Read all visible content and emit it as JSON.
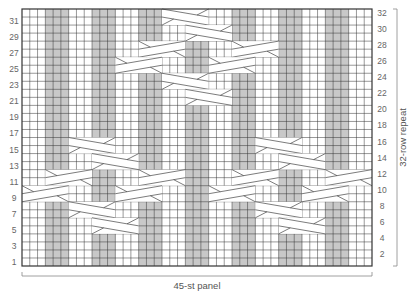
{
  "chart_data": {
    "type": "knitting-chart",
    "stitches": 45,
    "rows": 32,
    "bottom_label": "45-st panel",
    "side_label": "32-row repeat",
    "left_row_numbers": [
      1,
      3,
      5,
      7,
      9,
      11,
      13,
      15,
      17,
      19,
      21,
      23,
      25,
      27,
      29,
      31
    ],
    "right_row_numbers": [
      2,
      4,
      6,
      8,
      10,
      12,
      14,
      16,
      18,
      20,
      22,
      24,
      26,
      28,
      30,
      32
    ],
    "purl_columns": [
      [
        3,
        5
      ],
      [
        9,
        11
      ],
      [
        15,
        17
      ],
      [
        21,
        23
      ],
      [
        27,
        29
      ],
      [
        33,
        35
      ],
      [
        39,
        41
      ]
    ],
    "cables": [
      {
        "row": 31,
        "from": 18,
        "to": 24,
        "dir": "down-right"
      },
      {
        "row": 29,
        "from": 21,
        "to": 27,
        "dir": "down-right"
      },
      {
        "row": 27,
        "from": 15,
        "to": 21,
        "dir": "up-right"
      },
      {
        "row": 27,
        "from": 27,
        "to": 33,
        "dir": "up-right"
      },
      {
        "row": 25,
        "from": 12,
        "to": 18,
        "dir": "up-right"
      },
      {
        "row": 25,
        "from": 24,
        "to": 30,
        "dir": "up-right"
      },
      {
        "row": 23,
        "from": 18,
        "to": 24,
        "dir": "down-right"
      },
      {
        "row": 21,
        "from": 21,
        "to": 27,
        "dir": "down-right"
      },
      {
        "row": 15,
        "from": 6,
        "to": 12,
        "dir": "down-right"
      },
      {
        "row": 15,
        "from": 30,
        "to": 36,
        "dir": "down-right"
      },
      {
        "row": 13,
        "from": 9,
        "to": 15,
        "dir": "down-right"
      },
      {
        "row": 13,
        "from": 33,
        "to": 39,
        "dir": "down-right"
      },
      {
        "row": 11,
        "from": 3,
        "to": 9,
        "dir": "up-right"
      },
      {
        "row": 11,
        "from": 15,
        "to": 21,
        "dir": "up-right"
      },
      {
        "row": 11,
        "from": 27,
        "to": 33,
        "dir": "up-right"
      },
      {
        "row": 11,
        "from": 39,
        "to": 45,
        "dir": "up-right"
      },
      {
        "row": 9,
        "from": 0,
        "to": 6,
        "dir": "up-right"
      },
      {
        "row": 9,
        "from": 12,
        "to": 18,
        "dir": "up-right"
      },
      {
        "row": 9,
        "from": 24,
        "to": 30,
        "dir": "up-right"
      },
      {
        "row": 9,
        "from": 36,
        "to": 42,
        "dir": "up-right"
      },
      {
        "row": 7,
        "from": 6,
        "to": 12,
        "dir": "down-right"
      },
      {
        "row": 7,
        "from": 30,
        "to": 36,
        "dir": "down-right"
      },
      {
        "row": 5,
        "from": 9,
        "to": 15,
        "dir": "down-right"
      },
      {
        "row": 5,
        "from": 33,
        "to": 39,
        "dir": "down-right"
      }
    ],
    "colors": {
      "grid": "#333333",
      "purl": "#c8c8c8",
      "background": "#ffffff",
      "label": "#666666"
    }
  }
}
